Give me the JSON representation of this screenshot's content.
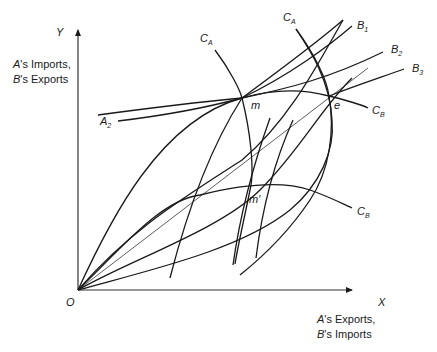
{
  "axes": {
    "y_letter": "Y",
    "x_letter": "X",
    "origin": "O",
    "y_title_line1_prefix": "A",
    "y_title_line1_rest": "'s Imports,",
    "y_title_line2_prefix": "B",
    "y_title_line2_rest": "'s Exports",
    "x_title_line1_prefix": "A",
    "x_title_line1_rest": "'s Exports,",
    "x_title_line2_prefix": "B",
    "x_title_line2_rest": "'s Imports"
  },
  "curve_labels": {
    "ca_left": {
      "base": "C",
      "sub": "A"
    },
    "ca_right": {
      "base": "C",
      "sub": "A"
    },
    "b1": {
      "base": "B",
      "sub": "1"
    },
    "b2": {
      "base": "B",
      "sub": "2"
    },
    "b3": {
      "base": "B",
      "sub": "3"
    },
    "a2": {
      "base": "A",
      "sub": "2"
    },
    "cb_upper": {
      "base": "C",
      "sub": "B"
    },
    "cb_lower": {
      "base": "C",
      "sub": "B"
    }
  },
  "points": {
    "m": "m",
    "e": "e",
    "m_prime": "m′"
  },
  "colors": {
    "ink": "#1a1a1a",
    "background": "#ffffff"
  }
}
